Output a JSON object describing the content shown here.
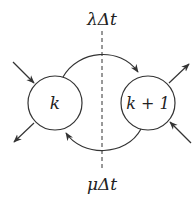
{
  "diagram": {
    "top_label": "λΔt",
    "bottom_label": "μΔt",
    "states": [
      {
        "id": "k",
        "label": "k"
      },
      {
        "id": "k1",
        "label": "k + 1"
      }
    ],
    "colors": {
      "stroke": "#333333",
      "background": "#ffffff"
    }
  }
}
